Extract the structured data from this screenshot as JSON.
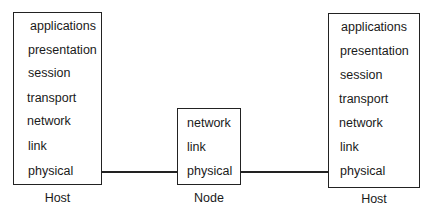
{
  "diagram": {
    "left_host": {
      "caption": "Host",
      "layers": [
        "applications",
        "presentation",
        "session",
        "transport",
        "network",
        "link",
        "physical"
      ]
    },
    "node": {
      "caption": "Node",
      "layers": [
        "network",
        "link",
        "physical"
      ]
    },
    "right_host": {
      "caption": "Host",
      "layers": [
        "applications",
        "presentation",
        "session",
        "transport",
        "network",
        "link",
        "physical"
      ]
    },
    "connections": [
      {
        "from": "left_host.physical",
        "to": "node.physical"
      },
      {
        "from": "node.physical",
        "to": "right_host.physical"
      }
    ]
  }
}
